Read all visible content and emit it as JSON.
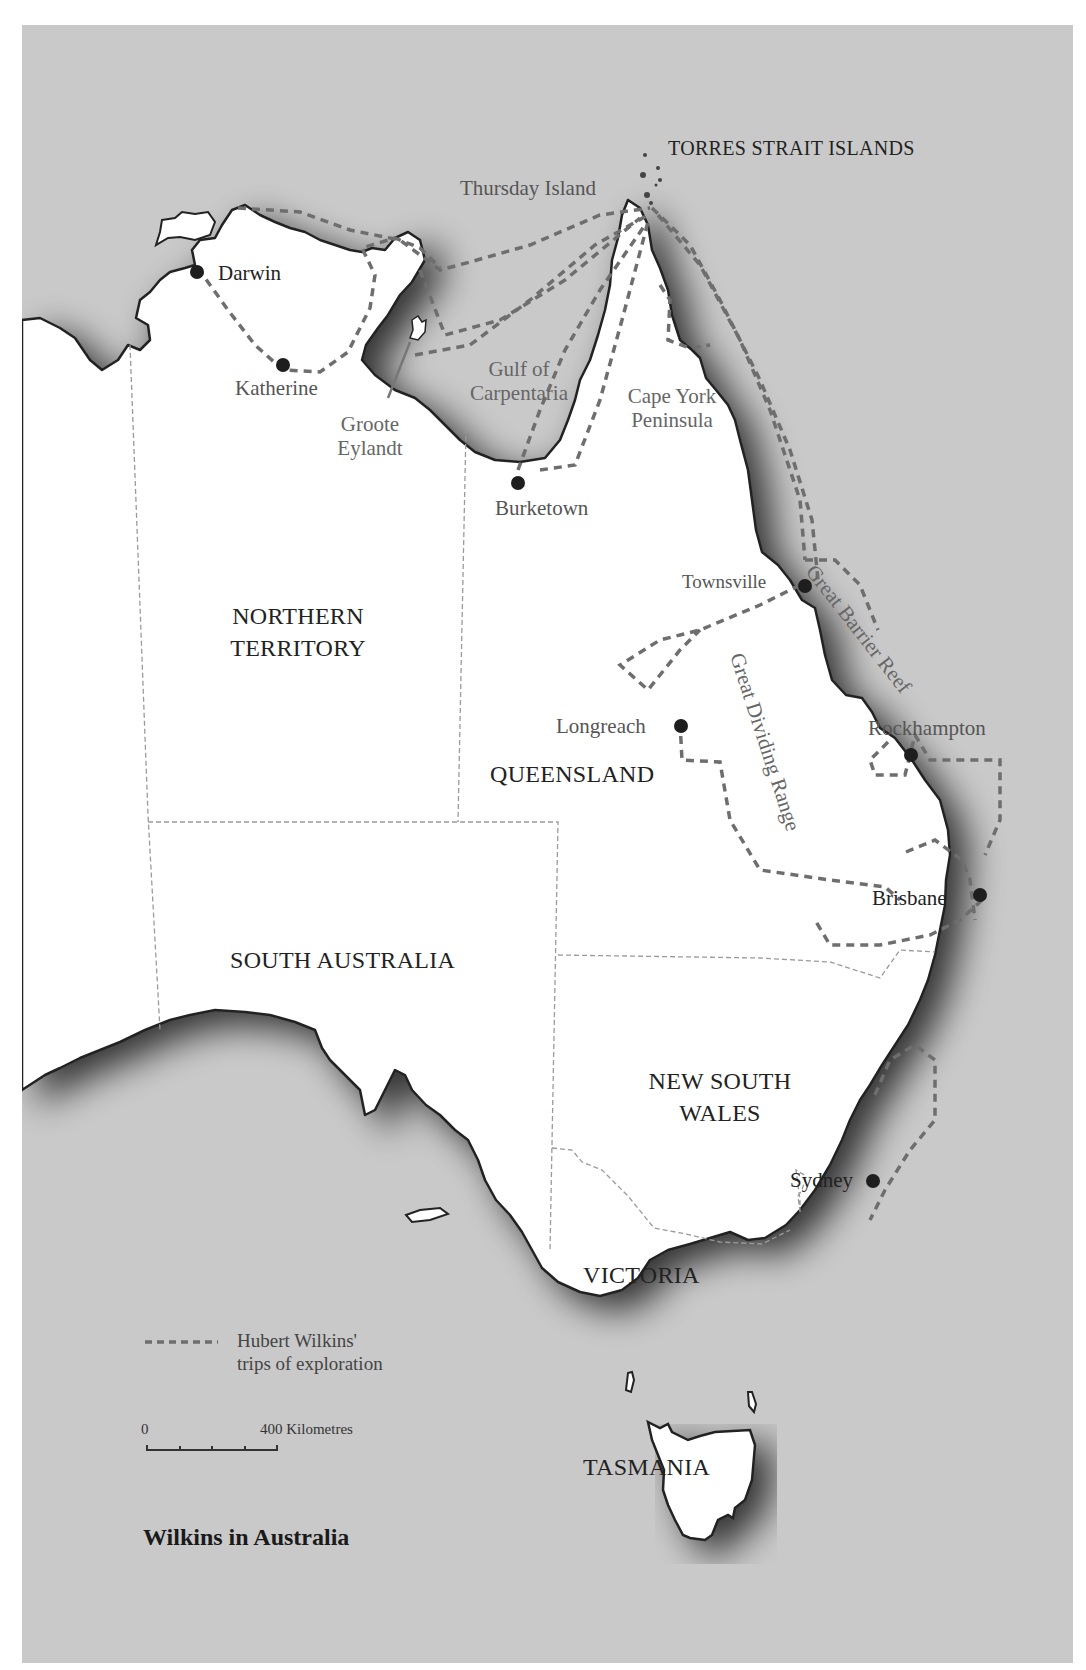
{
  "map": {
    "title": "Wilkins in Australia",
    "colors": {
      "sea": "#c9c9c9",
      "land": "#ffffff",
      "coast": "#222222",
      "route": "#6e6e6e",
      "border": "#9a9a9a",
      "city_dot": "#1e1e1e"
    },
    "regions": {
      "northern_territory": [
        "NORTHERN",
        "TERRITORY"
      ],
      "queensland": "QUEENSLAND",
      "south_australia": "SOUTH AUSTRALIA",
      "new_south_wales": [
        "NEW SOUTH",
        "WALES"
      ],
      "victoria": "VICTORIA",
      "tasmania": "TASMANIA",
      "torres_strait": "TORRES STRAIT ISLANDS"
    },
    "features": {
      "gulf": [
        "Gulf of",
        "Carpentaria"
      ],
      "cape_york": [
        "Cape York",
        "Peninsula"
      ],
      "groote": [
        "Groote",
        "Eylandt"
      ],
      "great_barrier_reef": "Great Barrier Reef",
      "great_dividing_range": "Great Dividing Range"
    },
    "cities": {
      "thursday_island": "Thursday Island",
      "darwin": "Darwin",
      "katherine": "Katherine",
      "burketown": "Burketown",
      "townsville": "Townsville",
      "longreach": "Longreach",
      "rockhampton": "Rockhampton",
      "brisbane": "Brisbane",
      "sydney": "Sydney"
    },
    "legend": {
      "route_line1": "Hubert Wilkins'",
      "route_line2": "trips of exploration"
    },
    "scale": {
      "start": "0",
      "end": "400 Kilometres"
    }
  }
}
